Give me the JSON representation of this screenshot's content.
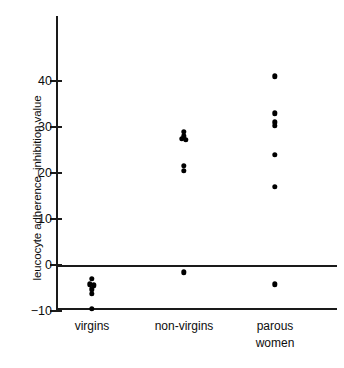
{
  "chart_data": {
    "type": "scatter",
    "title": "",
    "xlabel": "",
    "ylabel": "leucocyte adherence–inhibition value",
    "ylim": [
      -10,
      47
    ],
    "yticks": [
      -10,
      0,
      10,
      20,
      30,
      40
    ],
    "ytick_labels": [
      "−10",
      "0",
      "10",
      "20",
      "30",
      "40"
    ],
    "grid": false,
    "legend": false,
    "zero_reference_line": 0,
    "categories": [
      "virgins",
      "non-virgins",
      "parous women"
    ],
    "category_labels": [
      {
        "line1": "virgins",
        "line2": ""
      },
      {
        "line1": "non-virgins",
        "line2": ""
      },
      {
        "line1": "parous",
        "line2": "women"
      }
    ],
    "series": [
      {
        "name": "virgins",
        "x_position": 92,
        "points": [
          {
            "value": -3.0,
            "offset": 0
          },
          {
            "value": -4.2,
            "offset": -2
          },
          {
            "value": -4.4,
            "offset": 2
          },
          {
            "value": -5.3,
            "offset": 0
          },
          {
            "value": -6.2,
            "offset": 0
          },
          {
            "value": -9.5,
            "offset": 0
          }
        ]
      },
      {
        "name": "non-virgins",
        "x_position": 184,
        "points": [
          {
            "value": 29.0,
            "offset": 0
          },
          {
            "value": 28.0,
            "offset": 0
          },
          {
            "value": 27.4,
            "offset": -2
          },
          {
            "value": 27.2,
            "offset": 2
          },
          {
            "value": 21.5,
            "offset": 0
          },
          {
            "value": 20.5,
            "offset": 0
          },
          {
            "value": -1.6,
            "offset": 0
          }
        ]
      },
      {
        "name": "parous women",
        "x_position": 275,
        "points": [
          {
            "value": 41.0,
            "offset": 0
          },
          {
            "value": 33.0,
            "offset": 0
          },
          {
            "value": 31.0,
            "offset": 0
          },
          {
            "value": 30.3,
            "offset": 0
          },
          {
            "value": 24.0,
            "offset": 0
          },
          {
            "value": 17.0,
            "offset": 0
          },
          {
            "value": -4.2,
            "offset": 0
          }
        ]
      }
    ],
    "colors": {
      "point": "#000000",
      "axis": "#1a1a1a",
      "text": "#0d0d0d",
      "background": "#ffffff"
    }
  }
}
